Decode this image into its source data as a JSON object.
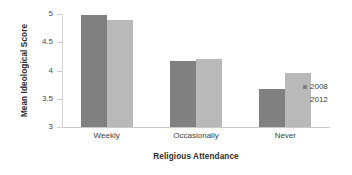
{
  "chart_data": {
    "type": "bar",
    "title": "",
    "xlabel": "Religious Attendance",
    "ylabel": "Mean Ideological Score",
    "categories": [
      "Weekly",
      "Occasionally",
      "Never"
    ],
    "series": [
      {
        "name": "2008",
        "color": "#808080",
        "values": [
          4.98,
          4.17,
          3.68
        ]
      },
      {
        "name": "2012",
        "color": "#b9b9b9",
        "values": [
          4.9,
          4.21,
          3.95
        ]
      }
    ],
    "ylim": [
      3,
      5
    ],
    "yticks": [
      3,
      3.5,
      4,
      4.5,
      5
    ],
    "ytick_labels": [
      "3",
      "3.5",
      "4",
      "4.5",
      "5"
    ],
    "grid": false,
    "legend_position": "right"
  },
  "axes": {
    "y_title": "Mean Ideological Score",
    "x_title": "Religious Attendance"
  },
  "legend": {
    "items": [
      {
        "label": "2008",
        "color": "#808080"
      },
      {
        "label": "2012",
        "color": "#b9b9b9"
      }
    ]
  }
}
